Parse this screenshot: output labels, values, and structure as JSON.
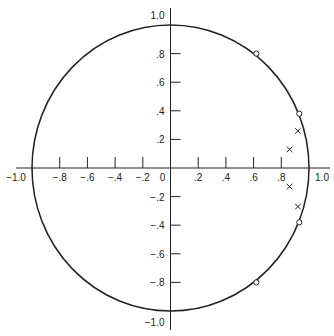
{
  "chart_data": {
    "type": "scatter",
    "title": "",
    "xlabel": "",
    "ylabel": "",
    "xlim": [
      -1.0,
      1.0
    ],
    "ylim": [
      -1.0,
      1.0
    ],
    "grid": false,
    "x_tick_labels": [
      "-1.0",
      "-.8",
      "-.6",
      "-.4",
      "-.2",
      "0",
      ".2",
      ".4",
      ".6",
      ".8",
      "1.0"
    ],
    "y_tick_labels": [
      "1.0",
      ".8",
      ".6",
      ".4",
      ".2",
      "-.2",
      "-.4",
      "-.6",
      "-.8",
      "-1.0"
    ],
    "unit_circle": true,
    "series": [
      {
        "name": "zeros",
        "marker": "o",
        "points": [
          [
            0.62,
            0.8
          ],
          [
            0.93,
            0.38
          ],
          [
            0.93,
            -0.38
          ],
          [
            0.62,
            -0.8
          ]
        ]
      },
      {
        "name": "poles",
        "marker": "x",
        "points": [
          [
            0.92,
            0.26
          ],
          [
            0.86,
            0.13
          ],
          [
            0.86,
            -0.13
          ],
          [
            0.92,
            -0.27
          ]
        ]
      }
    ]
  },
  "layout": {
    "cx": 170.5,
    "cy": 168,
    "rx": 138.5,
    "ry": 143
  }
}
